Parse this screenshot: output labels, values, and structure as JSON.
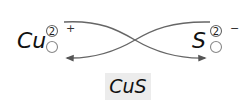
{
  "diagram": {
    "left_ion": {
      "symbol": "Cu",
      "electron_count": "2",
      "charge_sign": "+"
    },
    "right_ion": {
      "symbol": "S",
      "electron_count": "2",
      "charge_sign": "−"
    },
    "compound": {
      "formula": "CuS",
      "background": "#ececec"
    },
    "arrows": [
      {
        "from": "Cu",
        "to": "S",
        "description": "electron transfer Cu → S"
      },
      {
        "from": "S",
        "to": "Cu",
        "description": "electron transfer S → Cu"
      }
    ],
    "colors": {
      "text": "#111111",
      "arrow": "#555555",
      "circle": "#666666"
    }
  }
}
